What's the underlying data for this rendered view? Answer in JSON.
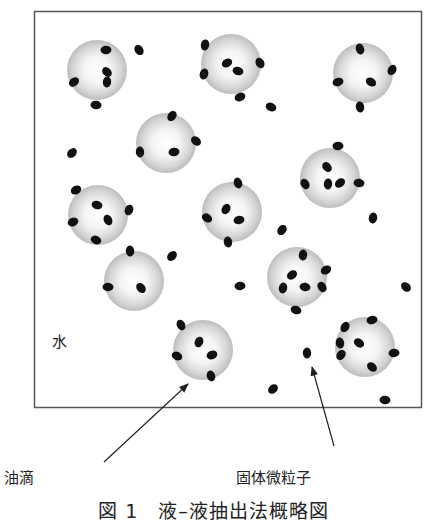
{
  "figure": {
    "water_label": "水",
    "oil_droplet_label": "油滴",
    "solid_particle_label": "固体微粒子",
    "caption": "図 1　液–液抽出法概略図"
  },
  "colors": {
    "border": "#555555",
    "droplet_center": "#ffffff",
    "droplet_edge": "#b8b8b8",
    "particle": "#111111",
    "arrow": "#222222"
  },
  "droplets": [
    {
      "cx": 97,
      "cy": 70,
      "r": 30
    },
    {
      "cx": 231,
      "cy": 64,
      "r": 30
    },
    {
      "cx": 363,
      "cy": 73,
      "r": 30
    },
    {
      "cx": 166,
      "cy": 143,
      "r": 30
    },
    {
      "cx": 330,
      "cy": 178,
      "r": 30
    },
    {
      "cx": 98,
      "cy": 215,
      "r": 30
    },
    {
      "cx": 232,
      "cy": 212,
      "r": 30
    },
    {
      "cx": 134,
      "cy": 281,
      "r": 30
    },
    {
      "cx": 297,
      "cy": 277,
      "r": 30
    },
    {
      "cx": 203,
      "cy": 350,
      "r": 30
    },
    {
      "cx": 365,
      "cy": 347,
      "r": 30
    }
  ],
  "particles": [
    [
      106,
      50
    ],
    [
      107,
      72
    ],
    [
      107,
      82
    ],
    [
      74,
      82
    ],
    [
      96,
      105
    ],
    [
      139,
      50
    ],
    [
      205,
      45
    ],
    [
      227,
      63
    ],
    [
      238,
      71
    ],
    [
      260,
      63
    ],
    [
      204,
      74
    ],
    [
      240,
      97
    ],
    [
      271,
      107
    ],
    [
      360,
      49
    ],
    [
      392,
      70
    ],
    [
      338,
      82
    ],
    [
      371,
      82
    ],
    [
      360,
      107
    ],
    [
      172,
      116
    ],
    [
      174,
      152
    ],
    [
      196,
      141
    ],
    [
      140,
      152
    ],
    [
      72,
      153
    ],
    [
      338,
      146
    ],
    [
      327,
      167
    ],
    [
      328,
      184
    ],
    [
      340,
      183
    ],
    [
      359,
      183
    ],
    [
      305,
      184
    ],
    [
      373,
      218
    ],
    [
      76,
      190
    ],
    [
      97,
      205
    ],
    [
      108,
      220
    ],
    [
      129,
      210
    ],
    [
      73,
      222
    ],
    [
      96,
      240
    ],
    [
      238,
      183
    ],
    [
      226,
      209
    ],
    [
      239,
      220
    ],
    [
      207,
      218
    ],
    [
      228,
      242
    ],
    [
      282,
      230
    ],
    [
      240,
      286
    ],
    [
      406,
      287
    ],
    [
      130,
      251
    ],
    [
      172,
      256
    ],
    [
      108,
      287
    ],
    [
      141,
      288
    ],
    [
      303,
      255
    ],
    [
      292,
      275
    ],
    [
      305,
      287
    ],
    [
      322,
      287
    ],
    [
      283,
      288
    ],
    [
      326,
      270
    ],
    [
      296,
      310
    ],
    [
      181,
      325
    ],
    [
      199,
      342
    ],
    [
      212,
      355
    ],
    [
      177,
      356
    ],
    [
      211,
      376
    ],
    [
      345,
      327
    ],
    [
      372,
      320
    ],
    [
      359,
      343
    ],
    [
      340,
      343
    ],
    [
      341,
      355
    ],
    [
      394,
      353
    ],
    [
      372,
      367
    ],
    [
      307,
      353
    ],
    [
      273,
      389
    ],
    [
      385,
      400
    ]
  ],
  "arrows": [
    {
      "from": [
        104,
        462
      ],
      "to": [
        188,
        384
      ],
      "name": "oil-droplet-arrow"
    },
    {
      "from": [
        334,
        446
      ],
      "to": [
        312,
        367
      ],
      "name": "solid-particle-arrow"
    }
  ]
}
